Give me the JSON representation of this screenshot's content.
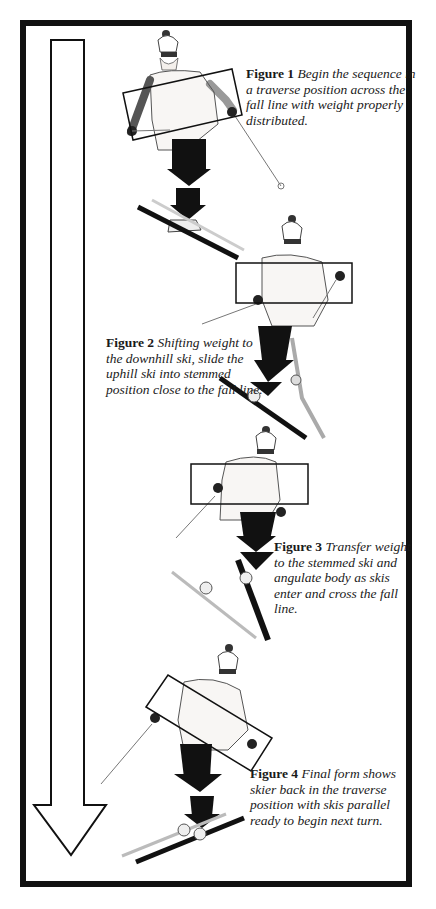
{
  "figure": {
    "type": "instructional-illustration",
    "colors": {
      "ink": "#111111",
      "paper": "#ffffff"
    },
    "direction_arrow": {
      "direction": "down",
      "style": "hollow-outline"
    }
  },
  "captions": [
    {
      "label": "Figure 1",
      "text": "Begin the sequence in a traverse position across the fall line with weight properly distributed."
    },
    {
      "label": "Figure 2",
      "text": "Shifting weight to the downhill ski, slide the uphill ski into stemmed position close to the fall line."
    },
    {
      "label": "Figure 3",
      "text": "Transfer weight to the stemmed ski and angulate body as skis enter and cross the fall line."
    },
    {
      "label": "Figure 4",
      "text": "Final form shows skier back in the traverse position with skis parallel ready to begin next turn."
    }
  ],
  "skiers": [
    {
      "name": "skier-1",
      "pose": "traverse",
      "shoulder_box": "tilted",
      "weight_arrows": 2
    },
    {
      "name": "skier-2",
      "pose": "stem",
      "shoulder_box": "level",
      "weight_arrows": 2
    },
    {
      "name": "skier-3",
      "pose": "stem-fall-line",
      "shoulder_box": "level",
      "weight_arrows": 2
    },
    {
      "name": "skier-4",
      "pose": "traverse-parallel",
      "shoulder_box": "tilted",
      "weight_arrows": 2
    }
  ]
}
